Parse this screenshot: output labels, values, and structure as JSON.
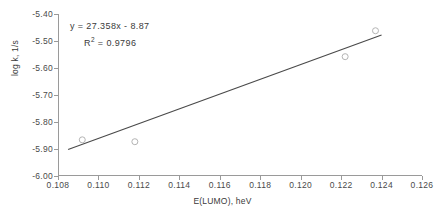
{
  "chart_data": {
    "type": "scatter",
    "title": "",
    "xlabel": "E(LUMO), heV",
    "ylabel": "log k, 1/s",
    "xlim": [
      0.108,
      0.126
    ],
    "ylim": [
      -6.0,
      -5.4
    ],
    "xticks": [
      "0.108",
      "0.110",
      "0.112",
      "0.114",
      "0.116",
      "0.118",
      "0.120",
      "0.122",
      "0.124",
      "0.126"
    ],
    "xtick_values": [
      0.108,
      0.11,
      0.112,
      0.114,
      0.116,
      0.118,
      0.12,
      0.122,
      0.124,
      0.126
    ],
    "yticks": [
      "-5.40",
      "-5.50",
      "-5.60",
      "-5.70",
      "-5.80",
      "-5.90",
      "-6.00"
    ],
    "ytick_values": [
      -5.4,
      -5.5,
      -5.6,
      -5.7,
      -5.8,
      -5.9,
      -6.0
    ],
    "grid": false,
    "legend": "none",
    "marker": "open-circle",
    "marker_color": "#b4b4b4",
    "line_color": "#4a4a4a",
    "axis_color": "#9a9a9a",
    "points": [
      {
        "x": 0.1092,
        "y": -5.866
      },
      {
        "x": 0.1118,
        "y": -5.873
      },
      {
        "x": 0.1222,
        "y": -5.558
      },
      {
        "x": 0.1237,
        "y": -5.462
      }
    ],
    "trendline": {
      "slope": 27.358,
      "intercept": -8.87,
      "r_squared": 0.9796,
      "x_start": 0.1085,
      "x_end": 0.124
    },
    "annotations": {
      "equation": "y = 27.358x - 8.87",
      "r2_prefix": "R",
      "r2_sup": "2",
      "r2_value": " =  0.9796"
    }
  }
}
